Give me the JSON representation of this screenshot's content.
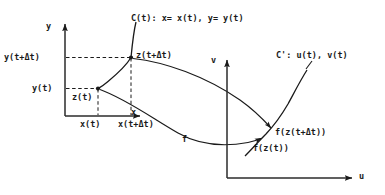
{
  "diagram": {
    "colors": {
      "ink": "#1a1a1a",
      "axis": "#2b2b2b",
      "curve": "#1a1a1a",
      "dash": "#1a1a1a",
      "background": "#ffffff"
    },
    "domain_plane": {
      "axis_y_label": "y",
      "axis_x_label": "x",
      "curve_label": "C(t): x= x(t), y= y(t)",
      "points": [
        {
          "name": "z-of-t",
          "label": "z(t)"
        },
        {
          "name": "z-of-t-plus-dt",
          "label": "z(t+Δt)"
        }
      ],
      "tick_labels_y": [
        {
          "name": "y-of-t-plus-dt",
          "label": "y(t+Δt)"
        },
        {
          "name": "y-of-t",
          "label": "y(t)"
        }
      ],
      "tick_labels_x": [
        {
          "name": "x-of-t",
          "label": "x(t)"
        },
        {
          "name": "x-of-t-plus-dt",
          "label": "x(t+Δt)"
        }
      ]
    },
    "map": {
      "label": "f"
    },
    "image_plane": {
      "axis_v_label": "v",
      "axis_u_label": "u",
      "curve_label": "C': u(t), v(t)",
      "points": [
        {
          "name": "f-of-z-of-t-plus-dt",
          "label": "f(z(t+Δt))"
        },
        {
          "name": "f-of-z-of-t",
          "label": "f(z(t))"
        }
      ]
    }
  }
}
